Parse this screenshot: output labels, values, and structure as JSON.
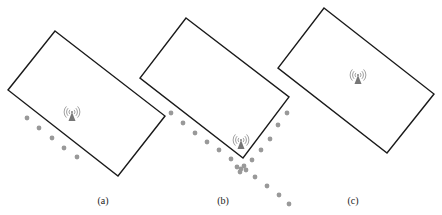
{
  "figure": {
    "colors": {
      "outline": "#1a1a1a",
      "dot": "#999999",
      "tower": "#777777",
      "label": "#222222"
    },
    "panels": [
      {
        "id": "a",
        "label": "(a)",
        "label_pos": [
          103,
          203
        ],
        "rect": [
          [
            55,
            31
          ],
          [
            165,
            116
          ],
          [
            118,
            176
          ],
          [
            8,
            90
          ]
        ],
        "tower": [
          72,
          117
        ],
        "dots": [
          [
            27,
            118
          ],
          [
            39,
            128
          ],
          [
            52,
            138
          ],
          [
            64,
            148
          ],
          [
            77,
            157
          ]
        ]
      },
      {
        "id": "b",
        "label": "(b)",
        "label_pos": [
          223,
          203
        ],
        "rect": [
          [
            186,
            18
          ],
          [
            289,
            97
          ],
          [
            243,
            158
          ],
          [
            140,
            78
          ]
        ],
        "tower": [
          241,
          145
        ],
        "dots": [
          [
            171,
            113
          ],
          [
            183,
            123
          ],
          [
            195,
            133
          ],
          [
            207,
            142
          ],
          [
            219,
            150
          ],
          [
            231,
            159
          ],
          [
            287,
            113
          ],
          [
            278,
            125
          ],
          [
            270,
            139
          ],
          [
            261,
            150
          ],
          [
            252,
            160
          ],
          [
            237,
            167
          ],
          [
            241,
            169
          ],
          [
            244,
            166
          ],
          [
            246,
            170
          ],
          [
            240,
            172
          ],
          [
            255,
            177
          ],
          [
            267,
            186
          ],
          [
            279,
            195
          ],
          [
            289,
            204
          ]
        ]
      },
      {
        "id": "c",
        "label": "(c)",
        "label_pos": [
          353,
          203
        ],
        "rect": [
          [
            324,
            8
          ],
          [
            434,
            94
          ],
          [
            387,
            153
          ],
          [
            278,
            68
          ]
        ],
        "tower": [
          358,
          80
        ],
        "dots": []
      }
    ]
  }
}
